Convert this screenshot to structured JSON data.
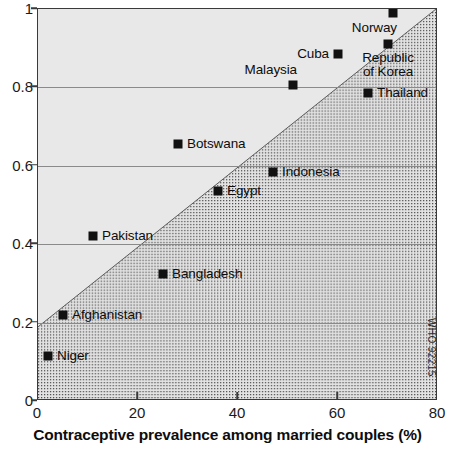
{
  "chart_data": {
    "type": "scatter",
    "title": "",
    "xlabel": "Contraceptive prevalence among married couples (%)",
    "ylabel": "",
    "xlim": [
      0,
      80
    ],
    "ylim": [
      0,
      1
    ],
    "xticks": [
      0,
      20,
      40,
      60,
      80
    ],
    "xticklabels": [
      "0",
      "20",
      "40",
      "60",
      "80"
    ],
    "yticks": [
      0,
      0.2,
      0.4,
      0.6,
      0.8,
      1
    ],
    "yticklabels": [
      "0",
      "0.2",
      "0.4",
      "0.6",
      "0.8",
      "1"
    ],
    "grid": "horizontal",
    "legend": "none",
    "marker_color": "#111111",
    "plot_background": "#e8e8e8",
    "band_fill": "stippled-gray",
    "points": [
      {
        "label": "Norway",
        "x": 71,
        "y": 0.99,
        "label_pos": "below-left"
      },
      {
        "label": "Republic\nof Korea",
        "x": 70,
        "y": 0.91,
        "label_pos": "below"
      },
      {
        "label": "Cuba",
        "x": 60,
        "y": 0.885,
        "label_pos": "left"
      },
      {
        "label": "Malaysia",
        "x": 51,
        "y": 0.805,
        "label_pos": "above-left"
      },
      {
        "label": "Thailand",
        "x": 66,
        "y": 0.785,
        "label_pos": "right"
      },
      {
        "label": "Botswana",
        "x": 28,
        "y": 0.655,
        "label_pos": "right"
      },
      {
        "label": "Indonesia",
        "x": 47,
        "y": 0.585,
        "label_pos": "right"
      },
      {
        "label": "Egypt",
        "x": 36,
        "y": 0.535,
        "label_pos": "right"
      },
      {
        "label": "Pakistan",
        "x": 11,
        "y": 0.42,
        "label_pos": "right"
      },
      {
        "label": "Bangladesh",
        "x": 25,
        "y": 0.325,
        "label_pos": "right"
      },
      {
        "label": "Afghanistan",
        "x": 5,
        "y": 0.22,
        "label_pos": "right"
      },
      {
        "label": "Niger",
        "x": 2,
        "y": 0.115,
        "label_pos": "right"
      }
    ],
    "band": {
      "description": "stippled diagonal region below a rising boundary line",
      "left_edge_y": 0.185,
      "right_edge_y": 1.0
    }
  },
  "watermark": {
    "text": "WHO 92215"
  }
}
